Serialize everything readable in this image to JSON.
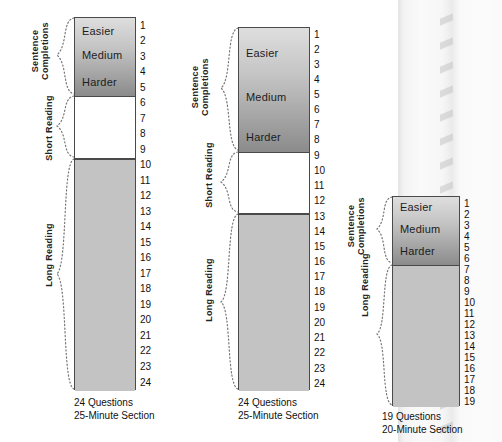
{
  "figure": {
    "type": "diagram",
    "title": "",
    "background": "#ffffff",
    "colors": {
      "sentence_completions_top": "#dedede",
      "sentence_completions_bottom": "#8b8b8b",
      "short_reading": "#ffffff",
      "long_reading": "#c3c3c3",
      "outline": "#4a4a4a",
      "text": "#1a1a1a"
    }
  },
  "difficulty_labels": {
    "easier": "Easier",
    "medium": "Medium",
    "harder": "Harder"
  },
  "group_labels": {
    "sentence_completions_line1": "Sentence",
    "sentence_completions_line2": "Completions",
    "short_reading": "Short Reading",
    "long_reading": "Long Reading"
  },
  "sections": [
    {
      "id": "section-1",
      "total_questions": 24,
      "caption_line1": "24 Questions",
      "caption_line2": "25-Minute Section",
      "numbers": [
        "1",
        "2",
        "3",
        "4",
        "5",
        "6",
        "7",
        "8",
        "9",
        "10",
        "11",
        "12",
        "13",
        "14",
        "15",
        "16",
        "17",
        "18",
        "19",
        "20",
        "21",
        "22",
        "23",
        "24"
      ],
      "groups": [
        {
          "name": "Sentence Completions",
          "first": 1,
          "last": 5,
          "count": 5,
          "fill": "gradient"
        },
        {
          "name": "Short Reading",
          "first": 6,
          "last": 9,
          "count": 4,
          "fill": "white"
        },
        {
          "name": "Long Reading",
          "first": 10,
          "last": 24,
          "count": 15,
          "fill": "gray"
        }
      ],
      "difficulty_marks": [
        {
          "label": "Easier",
          "at_question": 1
        },
        {
          "label": "Medium",
          "at_question": 2
        },
        {
          "label": "Harder",
          "at_question": 4
        }
      ]
    },
    {
      "id": "section-2",
      "total_questions": 24,
      "caption_line1": "24 Questions",
      "caption_line2": "25-Minute Section",
      "numbers": [
        "1",
        "2",
        "3",
        "4",
        "5",
        "6",
        "7",
        "8",
        "9",
        "10",
        "11",
        "12",
        "13",
        "14",
        "15",
        "16",
        "17",
        "18",
        "19",
        "20",
        "21",
        "22",
        "23",
        "24"
      ],
      "groups": [
        {
          "name": "Sentence Completions",
          "first": 1,
          "last": 8,
          "count": 8,
          "fill": "gradient"
        },
        {
          "name": "Short Reading",
          "first": 9,
          "last": 12,
          "count": 4,
          "fill": "white"
        },
        {
          "name": "Long Reading",
          "first": 13,
          "last": 24,
          "count": 12,
          "fill": "gray"
        }
      ],
      "difficulty_marks": [
        {
          "label": "Easier",
          "at_question": 2
        },
        {
          "label": "Medium",
          "at_question": 5
        },
        {
          "label": "Harder",
          "at_question": 7
        }
      ]
    },
    {
      "id": "section-3",
      "total_questions": 19,
      "caption_line1": "19 Questions",
      "caption_line2": "20-Minute Section",
      "numbers": [
        "1",
        "2",
        "3",
        "4",
        "5",
        "6",
        "7",
        "8",
        "9",
        "10",
        "11",
        "12",
        "13",
        "14",
        "15",
        "16",
        "17",
        "18",
        "19"
      ],
      "groups": [
        {
          "name": "Sentence Completions",
          "first": 1,
          "last": 6,
          "count": 6,
          "fill": "gradient"
        },
        {
          "name": "Long Reading",
          "first": 7,
          "last": 19,
          "count": 13,
          "fill": "gray"
        }
      ],
      "difficulty_marks": [
        {
          "label": "Easier",
          "at_question": 1
        },
        {
          "label": "Medium",
          "at_question": 3
        },
        {
          "label": "Harder",
          "at_question": 5
        }
      ]
    }
  ]
}
